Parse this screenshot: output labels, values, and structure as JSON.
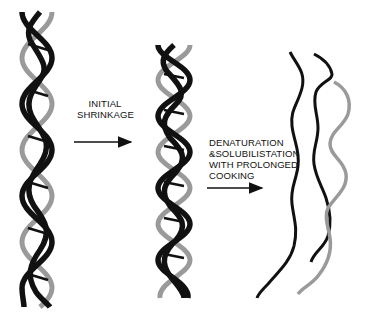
{
  "diagram": {
    "stages": [
      {
        "name": "native-triple-helix",
        "description": "intact collagen triple helix"
      },
      {
        "name": "shrunken-triple-helix",
        "description": "shortened triple helix after initial shrinkage"
      },
      {
        "name": "denatured-strands",
        "description": "separated random-coil chains"
      }
    ],
    "transitions": [
      {
        "lines": [
          "INITIAL",
          "SHRINKAGE"
        ]
      },
      {
        "lines": [
          "DENATURATION",
          "&SOLUBILISTATION",
          "WITH PROLONGED",
          "COOKING"
        ]
      }
    ],
    "colors": {
      "dark_strand": "#111111",
      "light_strand": "#9a9a9a",
      "background": "#ffffff"
    }
  }
}
